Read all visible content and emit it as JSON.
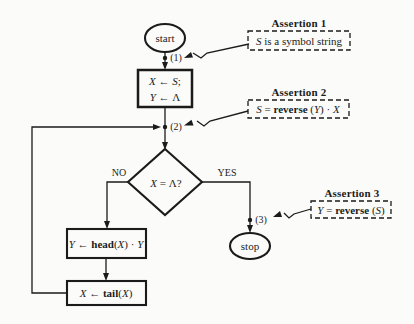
{
  "figure": {
    "type": "flowchart-with-assertions",
    "bg_color": "#fbfbf9",
    "ink_color": "#1b1b1b"
  },
  "flowchart": {
    "start": {
      "label": "start"
    },
    "stop": {
      "label": "stop"
    },
    "points": {
      "p1": "(1)",
      "p2": "(2)",
      "p3": "(3)"
    },
    "branches": {
      "no": "NO",
      "yes": "YES"
    },
    "init_box": {
      "line1": [
        {
          "t": "X",
          "s": "i"
        },
        {
          "t": " ← "
        },
        {
          "t": "S",
          "s": "i"
        },
        {
          "t": ";"
        }
      ],
      "line2": [
        {
          "t": "Y",
          "s": "i"
        },
        {
          "t": " ← Λ"
        }
      ]
    },
    "decision": {
      "runs": [
        {
          "t": "X",
          "s": "i"
        },
        {
          "t": " = Λ?"
        }
      ]
    },
    "head_box": {
      "runs": [
        {
          "t": "Y",
          "s": "i"
        },
        {
          "t": " ← "
        },
        {
          "t": "head",
          "s": "b"
        },
        {
          "t": "("
        },
        {
          "t": "X",
          "s": "i"
        },
        {
          "t": ") · "
        },
        {
          "t": "Y",
          "s": "i"
        }
      ]
    },
    "tail_box": {
      "runs": [
        {
          "t": "X",
          "s": "i"
        },
        {
          "t": " ← "
        },
        {
          "t": "tail",
          "s": "b"
        },
        {
          "t": "("
        },
        {
          "t": "X",
          "s": "i"
        },
        {
          "t": ")"
        }
      ]
    }
  },
  "assertions": {
    "a1": {
      "title": "Assertion 1",
      "runs": [
        {
          "t": "S",
          "s": "i"
        },
        {
          "t": " is a symbol string"
        }
      ]
    },
    "a2": {
      "title": "Assertion 2",
      "runs": [
        {
          "t": "S",
          "s": "i"
        },
        {
          "t": " = "
        },
        {
          "t": "reverse",
          "s": "b"
        },
        {
          "t": " ("
        },
        {
          "t": "Y",
          "s": "i"
        },
        {
          "t": ") · "
        },
        {
          "t": "X",
          "s": "i"
        }
      ]
    },
    "a3": {
      "title": "Assertion 3",
      "runs": [
        {
          "t": "Y",
          "s": "i"
        },
        {
          "t": " = "
        },
        {
          "t": "reverse",
          "s": "b"
        },
        {
          "t": " ("
        },
        {
          "t": "S",
          "s": "i"
        },
        {
          "t": ")"
        }
      ]
    }
  }
}
